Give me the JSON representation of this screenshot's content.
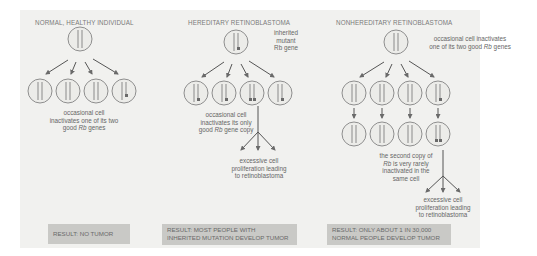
{
  "figure": {
    "background": "#f1f1ef",
    "stroke_color": "#8a8a8a",
    "result_box_color": "#c9c9c6"
  },
  "columns": [
    {
      "title": "NORMAL, HEALTHY INDIVIDUAL",
      "labels": {
        "annotation_1": "occasional cell",
        "annotation_2": "inactivates one of its two",
        "annotation_3_pre": "good ",
        "annotation_3_gene": "Rb",
        "annotation_3_post": " genes"
      },
      "result": {
        "line_1": "RESULT: NO TUMOR"
      }
    },
    {
      "title": "HEREDITARY RETINOBLASTOMA",
      "labels": {
        "inherited_1": "inherited",
        "inherited_2": "mutant",
        "inherited_3": "Rb gene",
        "annotation_1": "occasional cell",
        "annotation_2": "inactivates its only",
        "annotation_3_pre": "good ",
        "annotation_3_gene": "Rb",
        "annotation_3_post": " gene copy",
        "outcome_1": "excessive cell",
        "outcome_2": "proliferation leading",
        "outcome_3": "to retinoblastoma"
      },
      "result": {
        "line_1": "RESULT: MOST PEOPLE WITH",
        "line_2": "INHERITED MUTATION DEVELOP TUMOR"
      }
    },
    {
      "title": "NONHEREDITARY RETINOBLASTOMA",
      "labels": {
        "top_1": "occasional cell inactivates",
        "top_2_pre": "one of its two good ",
        "top_2_gene": "Rb",
        "top_2_post": " genes",
        "second_1": "the second copy of",
        "second_2_gene": "Rb",
        "second_2_post": " is very rarely",
        "second_3": "inactivated in the",
        "second_4": "same cell",
        "outcome_1": "excessive cell",
        "outcome_2": "proliferation leading",
        "outcome_3": "to retinoblastoma"
      },
      "result": {
        "line_1": "RESULT: ONLY ABOUT 1 IN 30,000",
        "line_2": "NORMAL PEOPLE DEVELOP TUMOR"
      }
    }
  ]
}
